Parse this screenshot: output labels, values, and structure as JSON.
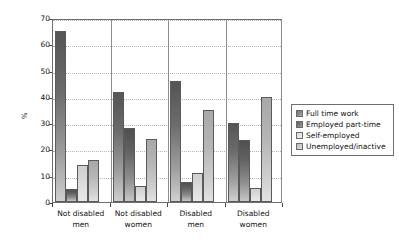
{
  "chart_data": {
    "type": "bar",
    "title": "",
    "subtitle": "",
    "xlabel": "",
    "ylabel": "%",
    "ylim": [
      0,
      70
    ],
    "yticks": [
      0,
      10,
      20,
      30,
      40,
      50,
      60,
      70
    ],
    "ytick_labels": [
      "0",
      "10",
      "20",
      "30",
      "40",
      "50",
      "60",
      "70"
    ],
    "grid": true,
    "grid_axis": "y",
    "legend_position": "right",
    "categories": [
      "Not disabled men",
      "Not disabled women",
      "Disabled men",
      "Disabled women"
    ],
    "category_lines": [
      [
        "Not disabled",
        "men"
      ],
      [
        "Not disabled",
        "women"
      ],
      [
        "Disabled",
        "men"
      ],
      [
        "Disabled",
        "women"
      ]
    ],
    "series": [
      {
        "name": "Full time work",
        "color": "#6b6b6b",
        "values": [
          65,
          42,
          46,
          30
        ]
      },
      {
        "name": "Employed part-time",
        "color": "#5e5e5e",
        "values": [
          5,
          28,
          7.5,
          23.5
        ]
      },
      {
        "name": "Self-employed",
        "color": "#dcdcdc",
        "values": [
          14,
          6,
          11,
          5.5
        ]
      },
      {
        "name": "Unemployed/inactive",
        "color": "#bdbdbd",
        "values": [
          16,
          24,
          35,
          40
        ]
      }
    ]
  },
  "legend": {
    "items": [
      {
        "label": "Full time work"
      },
      {
        "label": "Employed part-time"
      },
      {
        "label": "Self-employed"
      },
      {
        "label": "Unemployed/inactive"
      }
    ]
  }
}
